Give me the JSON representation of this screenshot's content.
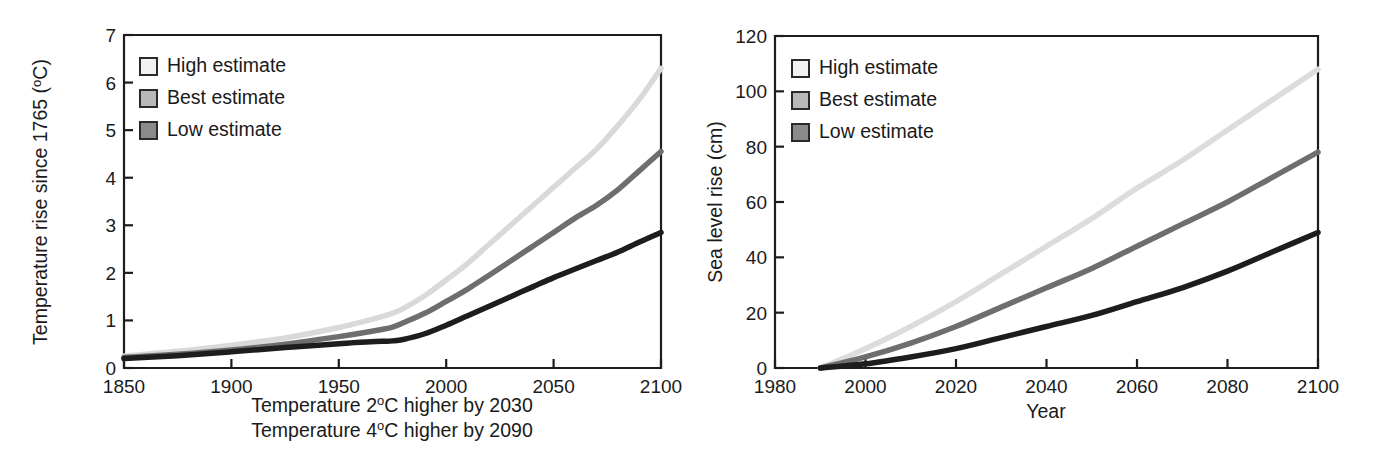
{
  "figure": {
    "background": "#ffffff",
    "ink_color": "#1a1a1a"
  },
  "legend_common": {
    "items": [
      {
        "label": "High estimate",
        "swatch_color": "#f2f2f2",
        "icon": "legend-swatch-icon"
      },
      {
        "label": "Best estimate",
        "swatch_color": "#b8b8b8",
        "icon": "legend-swatch-icon"
      },
      {
        "label": "Low estimate",
        "swatch_color": "#8a8a8a",
        "icon": "legend-swatch-icon"
      }
    ]
  },
  "captions": {
    "left_line1_a": "Temperature 2",
    "left_line1_sup": "o",
    "left_line1_b": "C higher by 2030",
    "left_line2_a": "Temperature 4",
    "left_line2_sup": "o",
    "left_line2_b": "C higher by 2090"
  },
  "axis_text": {
    "left_y_a": "Temperature rise since 1765 (",
    "left_y_sup": "o",
    "left_y_b": "C)",
    "left_x": "",
    "right_y": "Sea level rise (cm)",
    "right_x": "Year"
  },
  "chart_data": [
    {
      "id": "temperature-rise-chart",
      "type": "line",
      "title": "",
      "xlabel": "",
      "ylabel": "Temperature rise since 1765 (°C)",
      "xlim": [
        1850,
        2100
      ],
      "ylim": [
        0,
        7
      ],
      "xticks": [
        1850,
        1900,
        1950,
        2000,
        2050,
        2100
      ],
      "xticklabels": [
        "1850",
        "1900",
        "1950",
        "2000",
        "2050",
        "2100"
      ],
      "yticks": [
        0,
        1,
        2,
        3,
        4,
        5,
        6,
        7
      ],
      "yticklabels": [
        "0",
        "1",
        "2",
        "3",
        "4",
        "5",
        "6",
        "7"
      ],
      "grid": false,
      "legend_position": "top-left",
      "annotations": [
        "Temperature 2°C higher by 2030",
        "Temperature 4°C higher by 2090"
      ],
      "x": [
        1850,
        1875,
        1900,
        1925,
        1950,
        1960,
        1970,
        1975,
        1980,
        1990,
        2000,
        2010,
        2020,
        2030,
        2040,
        2050,
        2060,
        2070,
        2080,
        2090,
        2100
      ],
      "series": [
        {
          "name": "High estimate",
          "color": "#d9d9d9",
          "values": [
            0.25,
            0.35,
            0.48,
            0.63,
            0.85,
            0.96,
            1.08,
            1.15,
            1.25,
            1.52,
            1.85,
            2.2,
            2.6,
            3.0,
            3.4,
            3.8,
            4.2,
            4.6,
            5.1,
            5.65,
            6.3
          ]
        },
        {
          "name": "Best estimate",
          "color": "#6e6e6e",
          "values": [
            0.22,
            0.29,
            0.38,
            0.5,
            0.66,
            0.73,
            0.81,
            0.86,
            0.95,
            1.15,
            1.4,
            1.66,
            1.95,
            2.25,
            2.55,
            2.85,
            3.15,
            3.42,
            3.75,
            4.15,
            4.55
          ]
        },
        {
          "name": "Low estimate",
          "color": "#1d1d1d",
          "values": [
            0.2,
            0.26,
            0.34,
            0.43,
            0.51,
            0.54,
            0.56,
            0.57,
            0.6,
            0.72,
            0.9,
            1.1,
            1.3,
            1.5,
            1.7,
            1.9,
            2.08,
            2.26,
            2.44,
            2.65,
            2.85
          ]
        }
      ]
    },
    {
      "id": "sea-level-rise-chart",
      "type": "line",
      "title": "",
      "xlabel": "Year",
      "ylabel": "Sea level rise (cm)",
      "xlim": [
        1980,
        2100
      ],
      "ylim": [
        0,
        120
      ],
      "xticks": [
        1980,
        2000,
        2020,
        2040,
        2060,
        2080,
        2100
      ],
      "xticklabels": [
        "1980",
        "2000",
        "2020",
        "2040",
        "2060",
        "2080",
        "2100"
      ],
      "yticks": [
        0,
        20,
        40,
        60,
        80,
        100,
        120
      ],
      "yticklabels": [
        "0",
        "20",
        "40",
        "60",
        "80",
        "100",
        "120"
      ],
      "grid": false,
      "legend_position": "top-left",
      "annotations": [],
      "x": [
        1990,
        2000,
        2010,
        2020,
        2030,
        2040,
        2050,
        2060,
        2070,
        2080,
        2090,
        2100
      ],
      "series": [
        {
          "name": "High estimate",
          "color": "#dcdcdc",
          "values": [
            0,
            7,
            15,
            24,
            34,
            44,
            54,
            65,
            75,
            86,
            97,
            108
          ]
        },
        {
          "name": "Best estimate",
          "color": "#6e6e6e",
          "values": [
            0,
            4,
            9,
            15,
            22,
            29,
            36,
            44,
            52,
            60,
            69,
            78
          ]
        },
        {
          "name": "Low estimate",
          "color": "#1d1d1d",
          "values": [
            0,
            1.5,
            4,
            7,
            11,
            15,
            19,
            24,
            29,
            35,
            42,
            49
          ]
        }
      ]
    }
  ]
}
